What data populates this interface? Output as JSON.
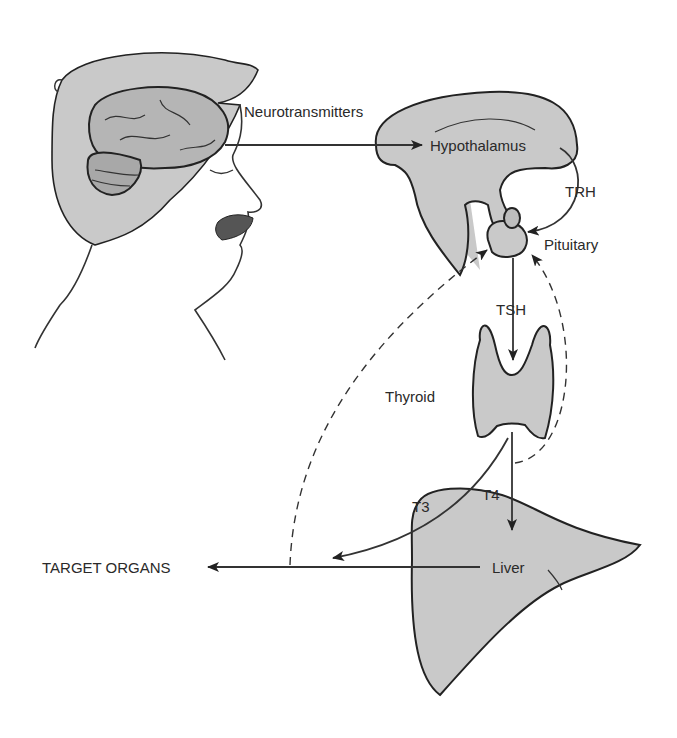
{
  "diagram": {
    "labels": {
      "neurotransmitters": "Neurotransmitters",
      "hypothalamus": "Hypothalamus",
      "trh": "TRH",
      "pituitary": "Pituitary",
      "tsh": "TSH",
      "thyroid": "Thyroid",
      "t3": "T3",
      "t4": "T4",
      "liver": "Liver",
      "target_organs": "TARGET ORGANS"
    },
    "nodes": [
      "Brain",
      "Hypothalamus",
      "Pituitary",
      "Thyroid",
      "Liver",
      "TARGET ORGANS"
    ],
    "edges": [
      {
        "from": "Brain",
        "to": "Hypothalamus",
        "label": "Neurotransmitters",
        "style": "solid"
      },
      {
        "from": "Hypothalamus",
        "to": "Pituitary",
        "label": "TRH",
        "style": "solid"
      },
      {
        "from": "Pituitary",
        "to": "Thyroid",
        "label": "TSH",
        "style": "solid"
      },
      {
        "from": "Thyroid",
        "to": "Liver",
        "label": "T4",
        "style": "solid"
      },
      {
        "from": "Thyroid",
        "to": "TARGET ORGANS",
        "label": "T3",
        "style": "solid"
      },
      {
        "from": "Liver",
        "to": "TARGET ORGANS",
        "label": "",
        "style": "solid"
      },
      {
        "from": "Thyroid",
        "to": "Pituitary",
        "label": "",
        "style": "dashed-feedback"
      },
      {
        "from": "TARGET ORGANS",
        "to": "Pituitary",
        "label": "",
        "style": "dashed-feedback"
      }
    ],
    "colors": {
      "fill": "#c9c9c9",
      "stroke": "#222222",
      "text": "#2a2a2a"
    }
  }
}
